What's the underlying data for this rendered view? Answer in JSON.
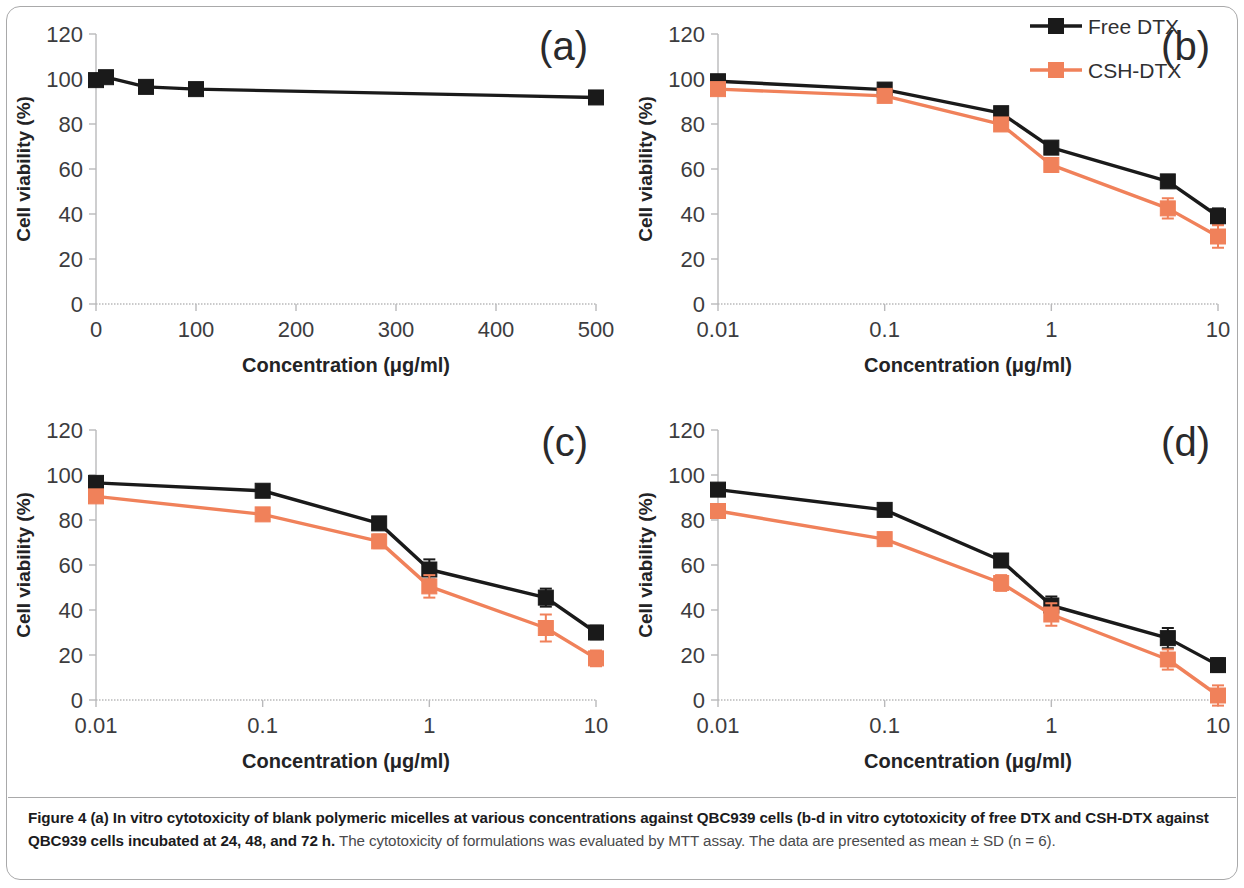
{
  "figure": {
    "caption_bold": "Figure 4 (a) In vitro cytotoxicity of blank polymeric micelles at various concentrations against QBC939 cells (b-d in vitro cytotoxicity of free DTX and CSH-DTX against QBC939 cells incubated at 24, 48, and 72 h.",
    "caption_rest": " The cytotoxicity of formulations was evaluated by MTT assay. The data are presented as mean ± SD (n = 6)."
  },
  "legend": {
    "position": "top-right of panel b",
    "entries": [
      {
        "label": "Free DTX",
        "color": "#1a1a1a",
        "marker": "square"
      },
      {
        "label": "CSH-DTX",
        "color": "#f0815a",
        "marker": "square"
      }
    ]
  },
  "colors": {
    "free_dtx": "#1a1a1a",
    "csh_dtx": "#f0815a",
    "axis": "#b9b9bb",
    "tick_text": "#3c3c3e",
    "frame": "#a9a9aa"
  },
  "chart_data": [
    {
      "id": "a",
      "type": "line",
      "panel_label": "(a)",
      "title": "",
      "xlabel": "Concentration (μg/ml)",
      "ylabel": "Cell viability (%)",
      "xscale": "linear",
      "xlim": [
        0,
        500
      ],
      "ylim": [
        0,
        120
      ],
      "yticks": [
        0,
        20,
        40,
        60,
        80,
        100,
        120
      ],
      "xticks": [
        0,
        100,
        200,
        300,
        400,
        500
      ],
      "grid": false,
      "series": [
        {
          "name": "Blank polymeric micelles",
          "color": "#1a1a1a",
          "x": [
            0,
            10,
            50,
            100,
            500
          ],
          "values": [
            99.5,
            100.8,
            96.5,
            95.5,
            91.8
          ],
          "errors": [
            2.2,
            2.0,
            1.8,
            2.6,
            1.6
          ]
        }
      ]
    },
    {
      "id": "b",
      "type": "line",
      "panel_label": "(b)",
      "title": "",
      "xlabel": "Concentration (μg/ml)",
      "ylabel": "Cell viability (%)",
      "xscale": "log",
      "xlim": [
        0.01,
        10
      ],
      "ylim": [
        0,
        120
      ],
      "yticks": [
        0,
        20,
        40,
        60,
        80,
        100,
        120
      ],
      "xticks": [
        0.01,
        0.1,
        1,
        10
      ],
      "xtick_labels": [
        "0.01",
        "0.1",
        "1",
        "10"
      ],
      "grid": false,
      "series": [
        {
          "name": "Free DTX",
          "color": "#1a1a1a",
          "x": [
            0.01,
            0.1,
            0.5,
            1,
            5,
            10
          ],
          "values": [
            99.0,
            95.3,
            84.8,
            69.5,
            54.5,
            39.0
          ],
          "errors": [
            1.5,
            1.5,
            2.0,
            2.0,
            2.5,
            3.5
          ]
        },
        {
          "name": "CSH-DTX",
          "color": "#f0815a",
          "x": [
            0.01,
            0.1,
            0.5,
            1,
            5,
            10
          ],
          "values": [
            95.5,
            92.5,
            79.8,
            61.8,
            42.5,
            30.0
          ],
          "errors": [
            1.2,
            2.0,
            2.0,
            3.0,
            4.5,
            5.0
          ]
        }
      ]
    },
    {
      "id": "c",
      "type": "line",
      "panel_label": "(c)",
      "title": "",
      "xlabel": "Concentration (μg/ml)",
      "ylabel": "Cell viability (%)",
      "xscale": "log",
      "xlim": [
        0.01,
        10
      ],
      "ylim": [
        0,
        120
      ],
      "yticks": [
        0,
        20,
        40,
        60,
        80,
        100,
        120
      ],
      "xticks": [
        0.01,
        0.1,
        1,
        10
      ],
      "xtick_labels": [
        "0.01",
        "0.1",
        "1",
        "10"
      ],
      "grid": false,
      "series": [
        {
          "name": "Free DTX",
          "color": "#1a1a1a",
          "x": [
            0.01,
            0.1,
            0.5,
            1,
            5,
            10
          ],
          "values": [
            96.5,
            93.0,
            78.5,
            58.0,
            45.5,
            30.0
          ],
          "errors": [
            1.5,
            1.5,
            2.5,
            4.5,
            4.0,
            3.0
          ]
        },
        {
          "name": "CSH-DTX",
          "color": "#f0815a",
          "x": [
            0.01,
            0.1,
            0.5,
            1,
            5,
            10
          ],
          "values": [
            90.5,
            82.5,
            70.5,
            50.5,
            32.0,
            18.5
          ],
          "errors": [
            1.5,
            1.5,
            3.0,
            5.0,
            6.0,
            3.5
          ]
        }
      ]
    },
    {
      "id": "d",
      "type": "line",
      "panel_label": "(d)",
      "title": "",
      "xlabel": "Concentration (μg/ml)",
      "ylabel": "Cell viability (%)",
      "xscale": "log",
      "xlim": [
        0.01,
        10
      ],
      "ylim": [
        0,
        120
      ],
      "yticks": [
        0,
        20,
        40,
        60,
        80,
        100,
        120
      ],
      "xticks": [
        0.01,
        0.1,
        1,
        10
      ],
      "xtick_labels": [
        "0.01",
        "0.1",
        "1",
        "10"
      ],
      "grid": false,
      "series": [
        {
          "name": "Free DTX",
          "color": "#1a1a1a",
          "x": [
            0.01,
            0.1,
            0.5,
            1,
            5,
            10
          ],
          "values": [
            93.5,
            84.5,
            62.0,
            42.0,
            27.5,
            15.5
          ],
          "errors": [
            1.5,
            1.5,
            2.5,
            4.0,
            4.5,
            3.0
          ]
        },
        {
          "name": "CSH-DTX",
          "color": "#f0815a",
          "x": [
            0.01,
            0.1,
            0.5,
            1,
            5,
            10
          ],
          "values": [
            84.0,
            71.5,
            52.0,
            38.0,
            18.0,
            2.0
          ],
          "errors": [
            1.5,
            1.5,
            3.5,
            5.0,
            4.5,
            4.5
          ]
        }
      ]
    }
  ]
}
